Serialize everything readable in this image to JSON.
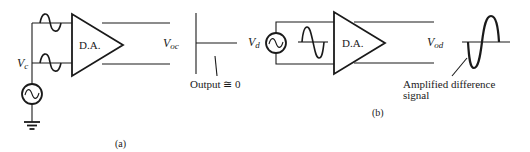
{
  "figure": {
    "panel_a": {
      "label": "(a)",
      "source_label": "V",
      "source_sub": "c",
      "amplifier_label": "D.A.",
      "output_label": "V",
      "output_sub": "oc",
      "output_annotation": "Output ≅ 0"
    },
    "panel_b": {
      "label": "(b)",
      "source_label": "V",
      "source_sub": "d",
      "amplifier_label": "D.A.",
      "output_label": "V",
      "output_sub": "od",
      "output_annotation_line1": "Amplified difference",
      "output_annotation_line2": "signal"
    },
    "colors": {
      "ink": "#1a1a1a",
      "background": "#ffffff"
    }
  }
}
